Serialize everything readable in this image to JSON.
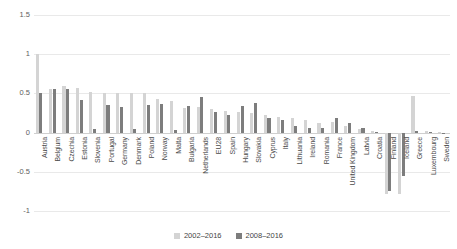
{
  "chart_data": {
    "type": "bar",
    "title": "",
    "xlabel": "",
    "ylabel": "",
    "ylim": [
      -1,
      1.5
    ],
    "yticks": [
      1.5,
      1,
      0.5,
      0,
      -0.5,
      -1
    ],
    "ytick_labels": [
      "1.5",
      "1",
      "0.5",
      "0",
      "-0.5",
      "-1"
    ],
    "grid": true,
    "legend_position": "bottom",
    "categories": [
      "Austria",
      "Belgium",
      "Czechia",
      "Estonia",
      "Slovenia",
      "Portugal",
      "Germany",
      "Denmark",
      "Poland",
      "Norway",
      "Malta",
      "Bulgaria",
      "Netherlands",
      "EU28",
      "Spain",
      "Hungary",
      "Slovakia",
      "Cyprus",
      "Italy",
      "Lithuania",
      "Ireland",
      "Romania",
      "France",
      "United Kingdom",
      "Latvia",
      "Croatia",
      "Finland",
      "Iceland",
      "Greece",
      "Luxembourg",
      "Sweden"
    ],
    "series": [
      {
        "name": "2002–2016",
        "color": "#d4d4d4",
        "values": [
          1.0,
          0.56,
          0.6,
          0.57,
          0.52,
          0.51,
          0.51,
          0.5,
          0.5,
          0.43,
          0.4,
          0.32,
          0.33,
          0.3,
          0.27,
          0.26,
          0.25,
          0.22,
          0.2,
          0.18,
          0.16,
          0.12,
          0.14,
          0.09,
          0.05,
          0.02,
          -0.78,
          -0.78,
          0.47,
          0.02,
          0.01
        ]
      },
      {
        "name": "2008–2016",
        "color": "#7d7d7d",
        "values": [
          0.5,
          0.55,
          0.56,
          0.42,
          0.05,
          0.35,
          0.33,
          0.04,
          0.35,
          0.36,
          0.03,
          0.34,
          0.46,
          0.26,
          0.23,
          0.34,
          0.38,
          0.18,
          0.16,
          0.08,
          0.06,
          0.06,
          0.19,
          0.12,
          0.06,
          0.01,
          -0.75,
          -0.55,
          0.02,
          0.01,
          0.0
        ]
      }
    ]
  },
  "legend": {
    "items": [
      {
        "label": "2002–2016",
        "color": "#d4d4d4"
      },
      {
        "label": "2008–2016",
        "color": "#7d7d7d"
      }
    ]
  }
}
